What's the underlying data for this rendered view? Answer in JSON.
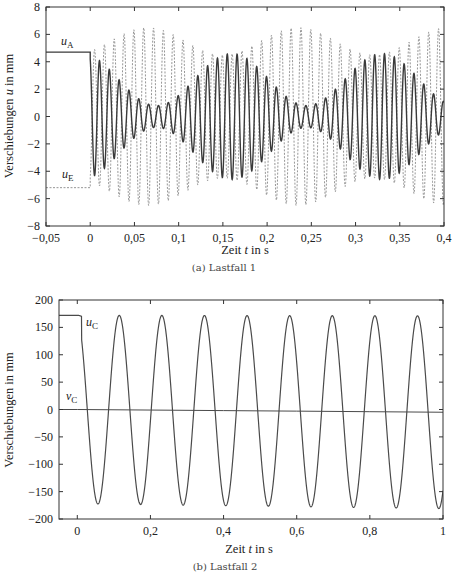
{
  "chart_data": [
    {
      "id": "a",
      "type": "line",
      "caption": "(a) Lastfall 1",
      "title": "",
      "xlabel": "Zeit t in s",
      "xlabel_parts": {
        "pre": "Zeit ",
        "var": "t",
        "post": " in s"
      },
      "ylabel": "Verschiebungen u in mm",
      "ylabel_parts": {
        "pre": "Verschiebungen ",
        "var": "u",
        "post": " in mm"
      },
      "xlim": [
        -0.05,
        0.4
      ],
      "ylim": [
        -8,
        8
      ],
      "xticks": [
        -0.05,
        0,
        0.05,
        0.1,
        0.15,
        0.2,
        0.25,
        0.3,
        0.35,
        0.4
      ],
      "xtick_labels": [
        "−0,05",
        "0",
        "0,05",
        "0,1",
        "0,15",
        "0,2",
        "0,25",
        "0,3",
        "0,35",
        "0,4"
      ],
      "yticks": [
        8,
        6,
        4,
        2,
        0,
        -2,
        -4,
        -6,
        -8
      ],
      "ytick_labels": [
        "8",
        "6",
        "4",
        "2",
        "0",
        "−2",
        "−4",
        "−6",
        "−8"
      ],
      "grid": false,
      "legend": "inline labels",
      "series": [
        {
          "name": "u_A",
          "label_main": "u",
          "label_sub": "A",
          "style": "solid",
          "color": "#3a3a3a",
          "initial_value": 4.7,
          "step_time": 0.0,
          "oscillation": {
            "frequency_hz": 90,
            "amp_max": 4.6,
            "amp_min": 0.8,
            "beat_period_s": 0.17,
            "envelope_min_at_s": 0.075
          },
          "sampled_peaks": {
            "t": [
              0.005,
              0.016,
              0.027,
              0.038,
              0.049,
              0.06,
              0.071,
              0.082,
              0.093,
              0.104,
              0.115,
              0.126,
              0.137,
              0.148,
              0.159,
              0.17,
              0.181,
              0.192,
              0.203,
              0.214,
              0.225,
              0.236,
              0.247,
              0.258,
              0.269,
              0.28,
              0.291,
              0.302,
              0.313,
              0.324,
              0.335,
              0.346,
              0.357,
              0.368,
              0.379,
              0.39
            ],
            "u": [
              4.3,
              3.9,
              3.1,
              2.5,
              1.4,
              0.8,
              1.1,
              1.8,
              2.8,
              3.6,
              4.1,
              4.4,
              4.3,
              3.8,
              3.1,
              2.4,
              1.7,
              1.3,
              2.0,
              2.9,
              3.7,
              4.2,
              4.5,
              4.5,
              4.3,
              4.0,
              3.4,
              2.6,
              1.7,
              1.0,
              1.3,
              2.3,
              3.3,
              4.0,
              4.4,
              4.6
            ]
          }
        },
        {
          "name": "u_E",
          "label_main": "u",
          "label_sub": "E",
          "style": "dashed",
          "color": "#8a8a8a",
          "initial_value": -5.2,
          "step_time": 0.0,
          "oscillation": {
            "frequency_hz": 90,
            "amp_max": 6.5,
            "amp_min": 4.5,
            "beat_period_s": 0.17,
            "envelope_max_at_s": 0.065
          },
          "sampled_peaks": {
            "t": [
              0.005,
              0.016,
              0.027,
              0.038,
              0.049,
              0.06,
              0.071,
              0.082,
              0.093,
              0.104,
              0.115,
              0.126,
              0.137,
              0.148,
              0.159,
              0.17,
              0.181,
              0.192,
              0.203,
              0.214,
              0.225,
              0.236,
              0.247,
              0.258,
              0.269,
              0.28,
              0.291,
              0.302,
              0.313,
              0.324,
              0.335,
              0.346,
              0.357,
              0.368,
              0.379,
              0.39
            ],
            "u": [
              5.0,
              5.4,
              5.8,
              6.1,
              6.4,
              6.5,
              6.4,
              6.1,
              5.7,
              5.3,
              4.9,
              4.6,
              4.5,
              4.7,
              5.0,
              5.4,
              5.9,
              6.2,
              6.4,
              6.4,
              6.2,
              5.9,
              5.5,
              5.1,
              4.8,
              4.6,
              4.5,
              4.6,
              4.9,
              5.3,
              5.7,
              6.1,
              6.3,
              6.4,
              6.2,
              5.8
            ]
          }
        }
      ]
    },
    {
      "id": "b",
      "type": "line",
      "caption": "(b) Lastfall 2",
      "title": "",
      "xlabel": "Zeit t in s",
      "xlabel_parts": {
        "pre": "Zeit ",
        "var": "t",
        "post": " in s"
      },
      "ylabel": "Verschiebungen in mm",
      "ylabel_parts": {
        "pre": "Verschiebungen in mm",
        "var": "",
        "post": ""
      },
      "xlim": [
        -0.05,
        1.0
      ],
      "ylim": [
        -200,
        200
      ],
      "xticks": [
        0,
        0.2,
        0.4,
        0.6,
        0.8,
        1
      ],
      "xtick_labels": [
        "0",
        "0,2",
        "0,4",
        "0,6",
        "0,8",
        "1"
      ],
      "yticks": [
        200,
        150,
        100,
        50,
        0,
        -50,
        -100,
        -150,
        -200
      ],
      "ytick_labels": [
        "200",
        "150",
        "100",
        "50",
        "0",
        "−50",
        "−100",
        "−150",
        "−200"
      ],
      "grid": false,
      "legend": "inline labels",
      "series": [
        {
          "name": "u_C",
          "label_main": "u",
          "label_sub": "C",
          "style": "solid",
          "color": "#4a4a4a",
          "initial_value": 172,
          "step_time": 0.0,
          "oscillation": {
            "period_s": 0.1165,
            "amplitude": 172,
            "first_trough_s": 0.0565
          },
          "peaks_t": [
            0.115,
            0.231,
            0.348,
            0.464,
            0.581,
            0.697,
            0.814,
            0.93
          ],
          "peaks_u": [
            171,
            170,
            170,
            169,
            168,
            168,
            167,
            166
          ],
          "troughs_t": [
            0.057,
            0.173,
            0.29,
            0.406,
            0.523,
            0.639,
            0.756,
            0.872,
            0.989
          ],
          "troughs_u": [
            -172,
            -173,
            -173,
            -174,
            -174,
            -175,
            -176,
            -176,
            -178
          ]
        },
        {
          "name": "v_C",
          "label_main": "v",
          "label_sub": "C",
          "style": "solid",
          "color": "#4a4a4a",
          "x": [
            -0.05,
            0.0,
            0.2,
            0.4,
            0.6,
            0.8,
            1.0
          ],
          "y": [
            0,
            0,
            -1,
            -2,
            -3,
            -4,
            -5
          ]
        }
      ]
    }
  ]
}
